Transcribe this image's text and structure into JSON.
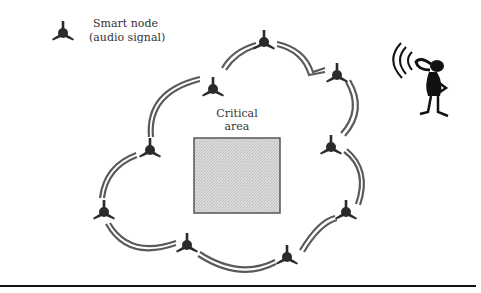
{
  "legend": {
    "icon": "smart-node-icon",
    "line1": "Smart node",
    "line2": "(audio signal)"
  },
  "critical_area": {
    "line1": "Critical",
    "line2": "area"
  },
  "listener": {
    "icon": "person-listening-icon",
    "signal_icon": "sound-waves-icon"
  },
  "network": {
    "node_count": 9,
    "link_style": "double-line arcs",
    "colors": {
      "node": "#2b2b2b",
      "link": "#5a5a5a",
      "area_fill": "#d6d6d6",
      "area_border": "#555555"
    }
  }
}
